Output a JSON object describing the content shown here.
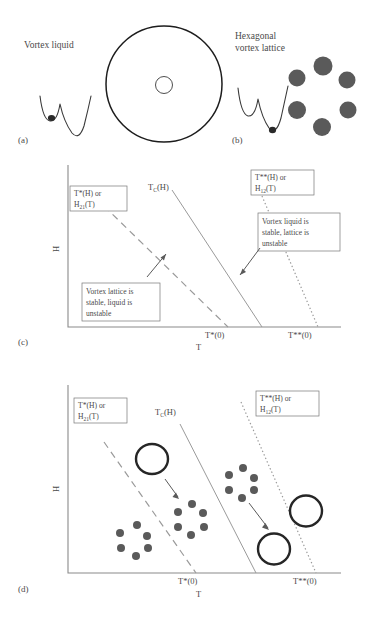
{
  "figure": {
    "panels": {
      "a": {
        "tag": "(a)",
        "title": "Vortex liquid",
        "icon_circle": "large-vortex-circle",
        "icon_well": "double-well-potential-left"
      },
      "b": {
        "tag": "(b)",
        "title_line1": "Hexagonal",
        "title_line2": "vortex lattice",
        "icon_well": "double-well-potential-right",
        "lattice_dots": 6
      },
      "c": {
        "tag": "(c)",
        "xlabel": "T",
        "ylabel": "H",
        "xticks": [
          "T*(0)",
          "T**(0)"
        ],
        "curves": [
          {
            "name": "T*(H) or H21(T)",
            "style": "dashed"
          },
          {
            "name": "TC(H)",
            "style": "solid"
          },
          {
            "name": "T**(H) or H12(T)",
            "style": "dotted"
          }
        ],
        "labels": {
          "left_curve_l1_main": "T*(H) or",
          "left_curve_l2_base": "H",
          "left_curve_l2_sub": "21",
          "left_curve_l2_tail": "(T)",
          "center_curve_base": "T",
          "center_curve_sub": "C",
          "center_curve_tail": "(H)",
          "right_curve_l1_main": "T**(H) or",
          "right_curve_l2_base": "H",
          "right_curve_l2_sub": "12",
          "right_curve_l2_tail": "(T)"
        },
        "annotations": [
          {
            "name": "lattice-stable-note",
            "line1": "Vortex lattice is",
            "line2": "stable, liquid is",
            "line3": "unstable"
          },
          {
            "name": "liquid-stable-note",
            "line1": "Vortex liquid is",
            "line2": "stable, lattice is",
            "line3": "unstable"
          }
        ]
      },
      "d": {
        "tag": "(d)",
        "xlabel": "T",
        "ylabel": "H",
        "xticks": [
          "T*(0)",
          "T**(0)"
        ],
        "labels": {
          "left_curve_l1_main": "T*(H) or",
          "left_curve_l2_base": "H",
          "left_curve_l2_sub": "21",
          "left_curve_l2_tail": "(T)",
          "center_curve_base": "T",
          "center_curve_sub": "C",
          "center_curve_tail": "(H)",
          "right_curve_l1_main": "T**(H) or",
          "right_curve_l2_base": "H",
          "right_curve_l2_sub": "12",
          "right_curve_l2_tail": "(T)"
        },
        "objects": [
          {
            "name": "lattice-cluster-far-left",
            "type": "hex-cluster"
          },
          {
            "name": "liquid-circle-upper-left",
            "type": "open-circle"
          },
          {
            "name": "lattice-cluster-center",
            "type": "hex-cluster"
          },
          {
            "name": "lattice-cluster-right",
            "type": "hex-cluster"
          },
          {
            "name": "liquid-circle-lower-right",
            "type": "open-circle"
          },
          {
            "name": "liquid-circle-far-right",
            "type": "open-circle"
          }
        ],
        "arrows": [
          {
            "name": "transition-arrow-left",
            "from": "liquid-circle-upper-left",
            "to": "lattice-cluster-center"
          },
          {
            "name": "transition-arrow-right",
            "from": "lattice-cluster-right",
            "to": "liquid-circle-lower-right"
          }
        ]
      }
    },
    "colors": {
      "ink": "#3a3a3a",
      "line": "#9a9a9a",
      "dot": "#5a5a5a",
      "circle": "#1d1d1d",
      "background": "#ffffff"
    }
  }
}
